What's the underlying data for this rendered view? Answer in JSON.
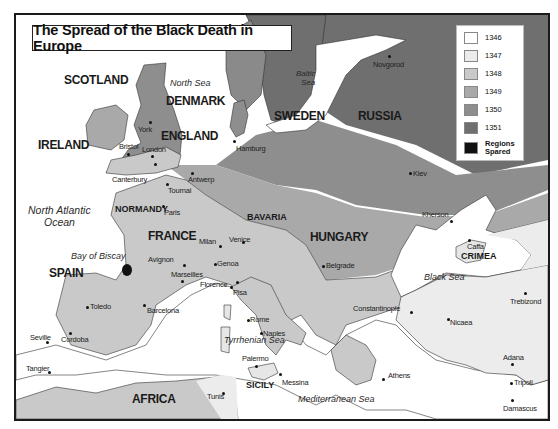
{
  "title": "The Spread of the Black Death in Europe",
  "legend": {
    "items": [
      {
        "label": "1346",
        "color": "#ffffff"
      },
      {
        "label": "1347",
        "color": "#ececec"
      },
      {
        "label": "1348",
        "color": "#c9c9c9"
      },
      {
        "label": "1349",
        "color": "#a9a9a9"
      },
      {
        "label": "1350",
        "color": "#8e8e8e"
      },
      {
        "label": "1351",
        "color": "#6f6f6f"
      },
      {
        "label": "Regions Spared",
        "color": "#111111"
      }
    ]
  },
  "countries": {
    "scotland": "SCOTLAND",
    "ireland": "IRELAND",
    "denmark": "DENMARK",
    "england": "ENGLAND",
    "sweden": "SWEDEN",
    "russia": "RUSSIA",
    "france": "FRANCE",
    "spain": "SPAIN",
    "hungary": "HUNGARY",
    "africa": "AFRICA"
  },
  "regions": {
    "normandy": "NORMANDY",
    "bavaria": "BAVARIA",
    "crimea": "CRIMEA",
    "sicily": "SICILY"
  },
  "waters": {
    "north_sea": "North Sea",
    "baltic_sea_1": "Baltic",
    "baltic_sea_2": "Sea",
    "north_atlantic_1": "North Atlantic",
    "north_atlantic_2": "Ocean",
    "bay_of_biscay": "Bay of Biscay",
    "black_sea": "Black Sea",
    "tyrrhenian_sea": "Tyrrhenian Sea",
    "mediterranean_sea": "Mediterranean Sea"
  },
  "cities": {
    "novgorod": "Novgorod",
    "york": "York",
    "bristol": "Bristol",
    "london": "London",
    "hamburg": "Hamburg",
    "antwerp": "Antwerp",
    "canterbury": "Canterbury",
    "tournai": "Tournai",
    "kiev": "Kiev",
    "paris": "Paris",
    "kherson": "Kherson",
    "caffa": "Caffa",
    "milan": "Milan",
    "venice": "Venice",
    "avignon": "Avignon",
    "genoa": "Genoa",
    "marseilles": "Marseilles",
    "florence": "Florence",
    "pisa": "Pisa",
    "belgrade": "Belgrade",
    "trebizond": "Trebizond",
    "toledo": "Toledo",
    "barcelona": "Barcelona",
    "rome": "Rome",
    "constantinople": "Constantinople",
    "nicaea": "Nicaea",
    "naples": "Naples",
    "seville": "Seville",
    "cordoba": "Cordoba",
    "palermo": "Palermo",
    "adana": "Adana",
    "tangier": "Tangier",
    "tunis": "Tunis",
    "messina": "Messina",
    "athens": "Athens",
    "tripoli": "Tripoli",
    "damascus": "Damascus"
  }
}
